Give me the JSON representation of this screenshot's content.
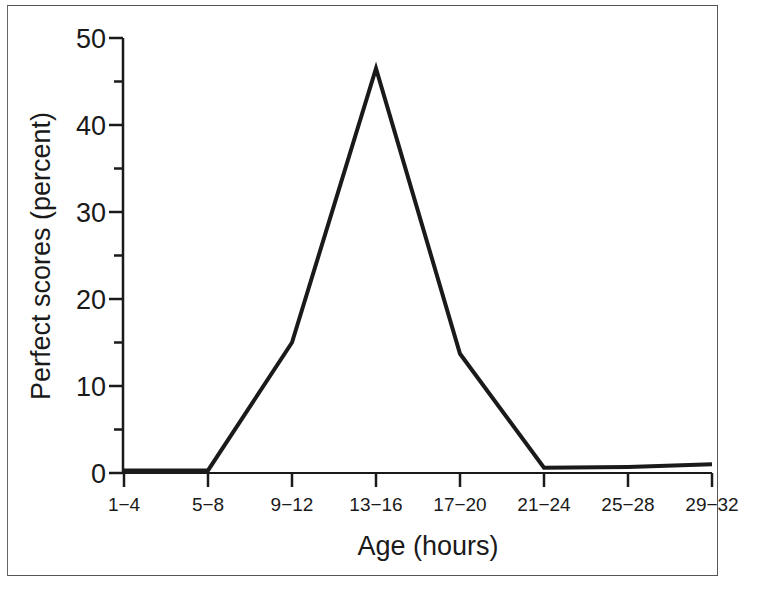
{
  "chart_data": {
    "type": "line",
    "title": "",
    "xlabel": "Age (hours)",
    "ylabel": "Perfect scores (percent)",
    "categories": [
      "1−4",
      "5−8",
      "9−12",
      "13−16",
      "17−20",
      "21−24",
      "25−28",
      "29−32"
    ],
    "series": [
      {
        "name": "Perfect scores",
        "values": [
          0.3,
          0.3,
          15,
          46.5,
          13.7,
          0.6,
          0.7,
          1.0
        ]
      }
    ],
    "ylim": [
      0,
      50
    ],
    "yticks_major": [
      0,
      10,
      20,
      30,
      40,
      50
    ],
    "yticks_minor": [
      5,
      15,
      25,
      35,
      45
    ],
    "grid": false,
    "legend": "none",
    "line_color": "#1a1a1a"
  },
  "axes": {
    "y_tick_labels": [
      "0",
      "10",
      "20",
      "30",
      "40",
      "50"
    ],
    "x_label": "Age (hours)",
    "y_label": "Perfect scores (percent)"
  }
}
